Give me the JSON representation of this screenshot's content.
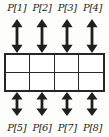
{
  "ports": {
    "top": [
      "P[1]",
      "P[2]",
      "P[3]",
      "P[4]"
    ],
    "bottom": [
      "P[5]",
      "P[6]",
      "P[7]",
      "P[8]"
    ]
  },
  "grid": {
    "rows": 2,
    "columns": 4,
    "cells": 8
  },
  "icons": {
    "arrow": "bidirectional-vertical-arrow"
  },
  "colors": {
    "ink": "#1f1f1f",
    "grid_line": "#2a2a2a",
    "background": "#fdfdfb"
  }
}
